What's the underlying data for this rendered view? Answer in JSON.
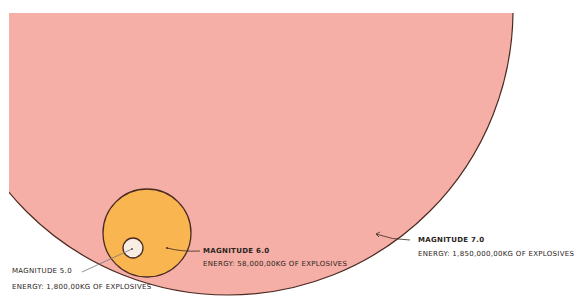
{
  "colors": {
    "magnitude_7_fill": "#F6AFA6",
    "magnitude_6_fill": "#F8B550",
    "magnitude_5_fill": "#F8EDE3",
    "outline": "#4A2A22",
    "leader": "#555555",
    "background": "#FFFFFF"
  },
  "circles": [
    {
      "id": "magnitude-7",
      "title": "MAGNITUDE 7.0",
      "energy": "ENERGY: 1,850,000,00KG OF EXPLOSIVES"
    },
    {
      "id": "magnitude-6",
      "title": "MAGNITUDE 6.0",
      "energy": "ENERGY: 58,000,00KG OF EXPLOSIVES"
    },
    {
      "id": "magnitude-5",
      "title": "MAGNITUDE 5.0",
      "energy": "ENERGY: 1,800,00KG OF EXPLOSIVES"
    }
  ]
}
